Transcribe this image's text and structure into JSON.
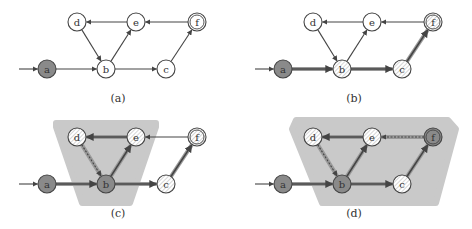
{
  "colors": {
    "edge": "#444444",
    "node_stroke": "#444444",
    "node_fill": "#ffffff",
    "node_filled": "#8a8a8a",
    "hatch": "#bbbbbb",
    "region": "#c9c9c9",
    "bold_edge_halo": "#9a9a9a"
  },
  "panels": [
    {
      "caption": "(a)",
      "offset": [
        0,
        0
      ],
      "nodes": [
        {
          "id": "a",
          "label": "a",
          "x": 47,
          "y": 69,
          "style": "filled"
        },
        {
          "id": "b",
          "label": "b",
          "x": 106,
          "y": 69,
          "style": "plain"
        },
        {
          "id": "c",
          "label": "c",
          "x": 166,
          "y": 69,
          "style": "plain"
        },
        {
          "id": "d",
          "label": "d",
          "x": 77,
          "y": 22,
          "style": "plain"
        },
        {
          "id": "e",
          "label": "e",
          "x": 136,
          "y": 22,
          "style": "plain"
        },
        {
          "id": "f",
          "label": "f",
          "x": 197,
          "y": 22,
          "style": "plain",
          "accepting": true
        }
      ],
      "edges": [
        {
          "from": "start",
          "to": "a",
          "style": "normal"
        },
        {
          "from": "a",
          "to": "b",
          "style": "normal"
        },
        {
          "from": "b",
          "to": "c",
          "style": "normal"
        },
        {
          "from": "d",
          "to": "b",
          "style": "normal"
        },
        {
          "from": "b",
          "to": "e",
          "style": "normal"
        },
        {
          "from": "e",
          "to": "d",
          "style": "normal"
        },
        {
          "from": "f",
          "to": "e",
          "style": "normal"
        },
        {
          "from": "c",
          "to": "f",
          "style": "normal"
        }
      ],
      "region": null
    },
    {
      "caption": "(b)",
      "offset": [
        236,
        0
      ],
      "nodes": [
        {
          "id": "a",
          "label": "a",
          "x": 47,
          "y": 69,
          "style": "filled"
        },
        {
          "id": "b",
          "label": "b",
          "x": 106,
          "y": 69,
          "style": "hatched"
        },
        {
          "id": "c",
          "label": "c",
          "x": 166,
          "y": 69,
          "style": "hatched"
        },
        {
          "id": "d",
          "label": "d",
          "x": 77,
          "y": 22,
          "style": "plain"
        },
        {
          "id": "e",
          "label": "e",
          "x": 136,
          "y": 22,
          "style": "plain"
        },
        {
          "id": "f",
          "label": "f",
          "x": 197,
          "y": 22,
          "style": "hatched",
          "accepting": true
        }
      ],
      "edges": [
        {
          "from": "start",
          "to": "a",
          "style": "normal"
        },
        {
          "from": "a",
          "to": "b",
          "style": "bold"
        },
        {
          "from": "b",
          "to": "c",
          "style": "bold"
        },
        {
          "from": "d",
          "to": "b",
          "style": "normal"
        },
        {
          "from": "b",
          "to": "e",
          "style": "normal"
        },
        {
          "from": "e",
          "to": "d",
          "style": "normal"
        },
        {
          "from": "f",
          "to": "e",
          "style": "normal"
        },
        {
          "from": "c",
          "to": "f",
          "style": "bold"
        }
      ],
      "region": null
    },
    {
      "caption": "(c)",
      "offset": [
        0,
        115
      ],
      "nodes": [
        {
          "id": "a",
          "label": "a",
          "x": 47,
          "y": 69,
          "style": "filled"
        },
        {
          "id": "b",
          "label": "b",
          "x": 106,
          "y": 69,
          "style": "filled"
        },
        {
          "id": "c",
          "label": "c",
          "x": 166,
          "y": 69,
          "style": "hatched"
        },
        {
          "id": "d",
          "label": "d",
          "x": 77,
          "y": 22,
          "style": "hatched"
        },
        {
          "id": "e",
          "label": "e",
          "x": 136,
          "y": 22,
          "style": "hatched"
        },
        {
          "id": "f",
          "label": "f",
          "x": 197,
          "y": 22,
          "style": "hatched",
          "accepting": true
        }
      ],
      "edges": [
        {
          "from": "start",
          "to": "a",
          "style": "normal"
        },
        {
          "from": "a",
          "to": "b",
          "style": "bold"
        },
        {
          "from": "b",
          "to": "c",
          "style": "bold"
        },
        {
          "from": "d",
          "to": "b",
          "style": "dashed"
        },
        {
          "from": "b",
          "to": "e",
          "style": "bold"
        },
        {
          "from": "e",
          "to": "d",
          "style": "bold"
        },
        {
          "from": "f",
          "to": "e",
          "style": "normal"
        },
        {
          "from": "c",
          "to": "f",
          "style": "bold"
        }
      ],
      "region": "56,8 156,8 156,12 130,88 82,88 56,12"
    },
    {
      "caption": "(d)",
      "offset": [
        236,
        115
      ],
      "nodes": [
        {
          "id": "a",
          "label": "a",
          "x": 47,
          "y": 69,
          "style": "filled"
        },
        {
          "id": "b",
          "label": "b",
          "x": 106,
          "y": 69,
          "style": "filled"
        },
        {
          "id": "c",
          "label": "c",
          "x": 166,
          "y": 69,
          "style": "hatched"
        },
        {
          "id": "d",
          "label": "d",
          "x": 77,
          "y": 22,
          "style": "hatched"
        },
        {
          "id": "e",
          "label": "e",
          "x": 136,
          "y": 22,
          "style": "hatched"
        },
        {
          "id": "f",
          "label": "f",
          "x": 197,
          "y": 22,
          "style": "filled",
          "accepting": true
        }
      ],
      "edges": [
        {
          "from": "start",
          "to": "a",
          "style": "normal"
        },
        {
          "from": "a",
          "to": "b",
          "style": "bold"
        },
        {
          "from": "b",
          "to": "c",
          "style": "bold"
        },
        {
          "from": "d",
          "to": "b",
          "style": "dashed"
        },
        {
          "from": "b",
          "to": "e",
          "style": "bold"
        },
        {
          "from": "e",
          "to": "d",
          "style": "bold"
        },
        {
          "from": "f",
          "to": "e",
          "style": "dashed"
        },
        {
          "from": "c",
          "to": "f",
          "style": "bold"
        }
      ],
      "region": "60,5 212,5 220,14 200,88 86,88 56,14"
    }
  ]
}
